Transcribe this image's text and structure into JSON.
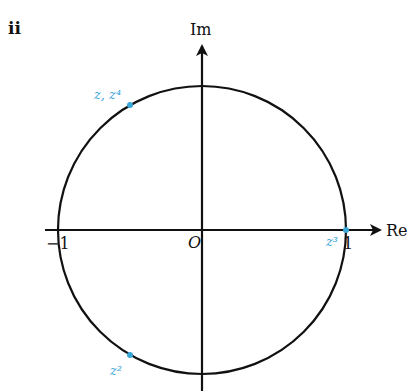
{
  "part_label": "ii",
  "axes": {
    "real_label": "Re",
    "imag_label": "Im",
    "origin_label": "O",
    "tick_neg_one": "−1",
    "tick_one": "1"
  },
  "points": [
    {
      "label": "z, z⁴",
      "angle_deg": 120
    },
    {
      "label": "z²",
      "angle_deg": 240
    },
    {
      "label": "z³",
      "angle_deg": 0
    }
  ],
  "colors": {
    "axis": "#111111",
    "circle": "#111111",
    "point": "#39a6d8"
  },
  "unit_circle_radius": 1
}
